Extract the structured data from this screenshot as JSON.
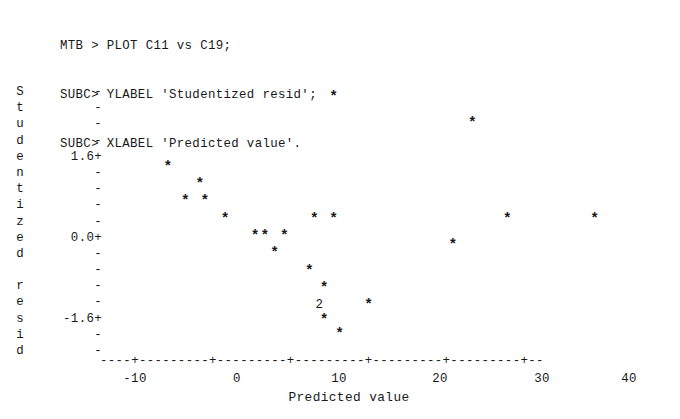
{
  "session": {
    "lines": [
      "MTB > PLOT C11 vs C19;",
      "SUBC> YLABEL 'Studentized resid';",
      "SUBC> XLABEL 'Predicted value'."
    ]
  },
  "plot": {
    "ylabel_text": "Studentized resid",
    "ylabel_chars": [
      "S",
      "t",
      "u",
      "d",
      "e",
      "n",
      "t",
      "i",
      "z",
      "e",
      "d",
      "",
      "r",
      "e",
      "s",
      "i",
      "d"
    ],
    "xlabel_text": "Predicted value",
    "y_axis": {
      "ticks": [
        "-",
        "-",
        "-",
        "-",
        "1.6+",
        "-",
        "-",
        "-",
        "-",
        "0.0+",
        "-",
        "-",
        "-",
        "-",
        "-1.6+",
        "-",
        "-"
      ],
      "labeled": [
        "1.6",
        "0.0",
        "-1.6"
      ],
      "label_rows": [
        4,
        9,
        14
      ],
      "rows": 17,
      "row_height_px": 16.2,
      "top_px": 84
    },
    "x_axis": {
      "rule": "----+---------+---------+---------+---------+---------+--",
      "tick_labels": [
        "-10",
        "0",
        "10",
        "20",
        "30",
        "40"
      ],
      "tick_values": [
        -10,
        0,
        10,
        20,
        30,
        40
      ],
      "tick_x_px": [
        135,
        237,
        339,
        440,
        542,
        629
      ]
    },
    "marker_symbol": "*",
    "overplot_symbol": "2",
    "ink_color": "#17181a",
    "background_color": "#ffffff"
  },
  "chart_data": {
    "type": "scatter",
    "title": "",
    "xlabel": "Predicted value",
    "ylabel": "Studentized resid",
    "xlim": [
      -13.2,
      42.5
    ],
    "ylim": [
      -2.6,
      3.1
    ],
    "xticks": [
      -10,
      0,
      10,
      20,
      30,
      40
    ],
    "yticks": [
      1.6,
      0.0,
      -1.6
    ],
    "grid": false,
    "legend": null,
    "marker": "*",
    "points": [
      {
        "x": 10.7,
        "y": 2.82,
        "label": "*",
        "count": 1
      },
      {
        "x": 25.0,
        "y": 2.28,
        "label": "*",
        "count": 1
      },
      {
        "x": -6.4,
        "y": 1.38,
        "label": "*",
        "count": 1
      },
      {
        "x": -3.1,
        "y": 1.02,
        "label": "*",
        "count": 1
      },
      {
        "x": -4.6,
        "y": 0.66,
        "label": "*",
        "count": 1
      },
      {
        "x": -2.6,
        "y": 0.66,
        "label": "*",
        "count": 1
      },
      {
        "x": -0.5,
        "y": 0.3,
        "label": "*",
        "count": 1
      },
      {
        "x": 8.7,
        "y": 0.3,
        "label": "*",
        "count": 1
      },
      {
        "x": 10.7,
        "y": 0.3,
        "label": "*",
        "count": 1
      },
      {
        "x": 28.6,
        "y": 0.3,
        "label": "*",
        "count": 1
      },
      {
        "x": 37.6,
        "y": 0.3,
        "label": "*",
        "count": 1
      },
      {
        "x": 2.6,
        "y": -0.06,
        "label": "*",
        "count": 1
      },
      {
        "x": 3.6,
        "y": -0.06,
        "label": "*",
        "count": 1
      },
      {
        "x": 5.6,
        "y": -0.06,
        "label": "*",
        "count": 1
      },
      {
        "x": 23.0,
        "y": -0.24,
        "label": "*",
        "count": 1
      },
      {
        "x": 4.6,
        "y": -0.42,
        "label": "*",
        "count": 1
      },
      {
        "x": 8.2,
        "y": -0.78,
        "label": "*",
        "count": 1
      },
      {
        "x": 9.7,
        "y": -1.14,
        "label": "*",
        "count": 1
      },
      {
        "x": 9.2,
        "y": -1.5,
        "label": "2",
        "count": 2
      },
      {
        "x": 14.3,
        "y": -1.5,
        "label": "*",
        "count": 1
      },
      {
        "x": 9.7,
        "y": -1.8,
        "label": "*",
        "count": 1
      },
      {
        "x": 11.3,
        "y": -2.1,
        "label": "*",
        "count": 1
      }
    ]
  }
}
